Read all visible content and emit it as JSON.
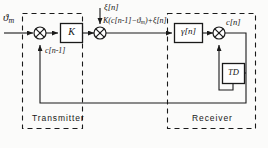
{
  "figure": {
    "type": "block-diagram",
    "background_color": "#fbfbfa",
    "line_color": "#1a1a1a"
  },
  "zones": [
    {
      "name": "transmitter",
      "label": "Transmitter",
      "style": "dashed"
    },
    {
      "name": "receiver",
      "label": "Receiver",
      "style": "dashed"
    }
  ],
  "signals": {
    "input": "ϑ",
    "input_sub": "m",
    "feedback": "c[n-1]",
    "noise": "ξ[n]",
    "channel": "K(c[n-1]−ϑ",
    "channel_sub": "m",
    "channel_tail": ")+ξ[n]",
    "output": "c[n]"
  },
  "blocks": [
    {
      "name": "gain-block",
      "label": "K"
    },
    {
      "name": "gamma-block",
      "label": "γ[n]"
    },
    {
      "name": "delay-block",
      "label": "TD"
    }
  ],
  "junctions": [
    {
      "name": "summing-junction-input",
      "glyph": "x"
    },
    {
      "name": "summing-junction-noise",
      "glyph": "x"
    },
    {
      "name": "summing-junction-output",
      "glyph": "x"
    }
  ]
}
